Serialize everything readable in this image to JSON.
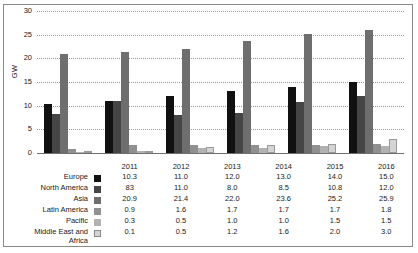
{
  "chart_data": {
    "type": "bar",
    "title": "",
    "xlabel": "",
    "ylabel": "GW",
    "ylim": [
      0,
      30
    ],
    "yticks": [
      0,
      5,
      10,
      15,
      20,
      25,
      30
    ],
    "grid": true,
    "legend_position": "table-left",
    "categories": [
      "2011",
      "2012",
      "2013",
      "2014",
      "2015",
      "2016"
    ],
    "series": [
      {
        "name": "Europe",
        "values": [
          10.3,
          11.0,
          12.0,
          13.0,
          14.0,
          15.0
        ],
        "color": "#111111"
      },
      {
        "name": "North America",
        "values": [
          8.3,
          11.0,
          8.0,
          8.5,
          10.8,
          12.0
        ],
        "color": "#454545"
      },
      {
        "name": "Asia",
        "values": [
          20.9,
          21.4,
          22.0,
          23.6,
          25.2,
          25.9
        ],
        "color": "#6e6e6e"
      },
      {
        "name": "Latin America",
        "values": [
          0.9,
          1.6,
          1.7,
          1.7,
          1.7,
          1.8
        ],
        "color": "#909090"
      },
      {
        "name": "Pacific",
        "values": [
          0.3,
          0.5,
          1.0,
          1.0,
          1.5,
          1.5
        ],
        "color": "#b2b2b2"
      },
      {
        "name": "Middle East and Africa",
        "values": [
          0.1,
          0.5,
          1.2,
          1.6,
          2.0,
          3.0
        ],
        "color": "#d4d4d4"
      }
    ]
  },
  "table": {
    "corner_label": "",
    "columns": [
      "2011",
      "2012",
      "2013",
      "2014",
      "2015",
      "2016"
    ],
    "rows": [
      {
        "label_line1": "Europe",
        "label_line2": "",
        "cells": [
          "10.3",
          "11.0",
          "12.0",
          "13.0",
          "14.0",
          "15.0"
        ]
      },
      {
        "label_line1": "North America",
        "label_line2": "",
        "cells": [
          "83",
          "11.0",
          "8.0",
          "8.5",
          "10.8",
          "12.0"
        ]
      },
      {
        "label_line1": "Asia",
        "label_line2": "",
        "cells": [
          "20.9",
          "21.4",
          "22.0",
          "23.6",
          "25.2",
          "25.9"
        ]
      },
      {
        "label_line1": "Latin America",
        "label_line2": "",
        "cells": [
          "0.9",
          "1.6",
          "1.7",
          "1.7",
          "1.7",
          "1.8"
        ]
      },
      {
        "label_line1": "Pacific",
        "label_line2": "",
        "cells": [
          "0.3",
          "0.5",
          "1.0",
          "1.0",
          "1.5",
          "1.5"
        ]
      },
      {
        "label_line1": "Middle East and",
        "label_line2": "Africa",
        "cells": [
          "0.1",
          "0.5",
          "1.2",
          "1.6",
          "2.0",
          "3.0"
        ]
      }
    ]
  }
}
